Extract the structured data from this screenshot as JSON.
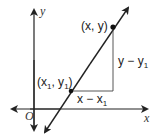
{
  "diagram": {
    "axes": {
      "x_label": "x",
      "y_label": "y",
      "origin_label": "O"
    },
    "points": [
      {
        "label": "(x, y)"
      },
      {
        "label_parts": [
          "(x",
          "1",
          ", y",
          "1",
          ")"
        ]
      }
    ],
    "legs": {
      "vertical": {
        "text": "y − y",
        "sub": "1"
      },
      "horizontal": {
        "text": "x − x",
        "sub": "1"
      }
    },
    "colors": {
      "line": "#222222",
      "axis": "#222222",
      "leg": "#444444",
      "background": "#ffffff"
    }
  }
}
